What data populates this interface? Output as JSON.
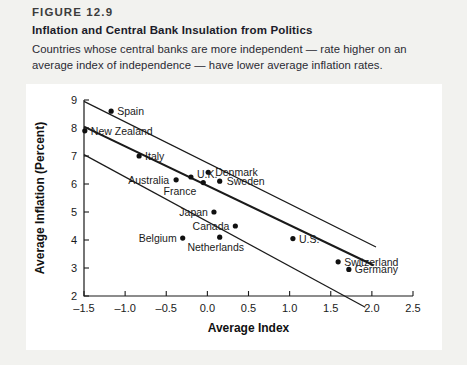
{
  "figure": {
    "label": "FIGURE 12.9",
    "title": "Inflation and Central Bank Insulation from Politics",
    "caption": "Countries whose central banks are more independent — rate higher on an average index of independence — have lower average inflation rates."
  },
  "colors": {
    "page_background": "#f2f2ef",
    "plot_background": "#ffffff",
    "axis": "#1a1a1a",
    "marker": "#101010",
    "line": "#1a1a1a",
    "text": "#1c1c2a"
  },
  "chart_data": {
    "type": "scatter",
    "title": "Inflation and Central Bank Insulation from Politics",
    "xlabel": "Average Index",
    "ylabel": "Average Inflation (Percent)",
    "xlim": [
      -1.5,
      2.5
    ],
    "ylim": [
      2,
      9
    ],
    "xticks": [
      -1.5,
      -1.0,
      -0.5,
      0.0,
      0.5,
      1.0,
      1.5,
      2.0,
      2.5
    ],
    "xtick_labels": [
      "–1.5",
      "–1.0",
      "–0.5",
      "0.0",
      "0.5",
      "1.0",
      "1.5",
      "2.0",
      "2.5"
    ],
    "yticks": [
      2,
      3,
      4,
      5,
      6,
      7,
      8,
      9
    ],
    "ytick_labels": [
      "2",
      "3",
      "4",
      "5",
      "6",
      "7",
      "8",
      "9"
    ],
    "grid": false,
    "legend": false,
    "points": [
      {
        "label": "Spain",
        "x": -1.17,
        "y": 8.6,
        "label_dx": 6,
        "label_dy": 4,
        "anchor": "start"
      },
      {
        "label": "New Zealand",
        "x": -1.49,
        "y": 7.9,
        "label_dx": 6,
        "label_dy": 4,
        "anchor": "start"
      },
      {
        "label": "Italy",
        "x": -0.83,
        "y": 7.0,
        "label_dx": 6,
        "label_dy": 4,
        "anchor": "start"
      },
      {
        "label": "U.K.",
        "x": -0.2,
        "y": 6.25,
        "label_dx": 6,
        "label_dy": 1,
        "anchor": "start"
      },
      {
        "label": "Denmark",
        "x": 0.01,
        "y": 6.42,
        "label_dx": 7,
        "label_dy": 4,
        "anchor": "start"
      },
      {
        "label": "Australia",
        "x": -0.38,
        "y": 6.15,
        "label_dx": -7,
        "label_dy": 4,
        "anchor": "end"
      },
      {
        "label": "Sweden",
        "x": 0.15,
        "y": 6.1,
        "label_dx": 7,
        "label_dy": 4,
        "anchor": "start"
      },
      {
        "label": "France",
        "x": -0.05,
        "y": 6.05,
        "label_dx": -7,
        "label_dy": 12,
        "anchor": "end"
      },
      {
        "label": "Japan",
        "x": 0.08,
        "y": 5.0,
        "label_dx": -6,
        "label_dy": 4,
        "anchor": "end"
      },
      {
        "label": "Canada",
        "x": 0.34,
        "y": 4.5,
        "label_dx": -6,
        "label_dy": 4,
        "anchor": "end"
      },
      {
        "label": "Netherlands",
        "x": 0.15,
        "y": 4.1,
        "label_dx": -4,
        "label_dy": 14,
        "anchor": "middle"
      },
      {
        "label": "Belgium",
        "x": -0.3,
        "y": 4.07,
        "label_dx": -6,
        "label_dy": 4,
        "anchor": "end"
      },
      {
        "label": "U.S.",
        "x": 1.04,
        "y": 4.05,
        "label_dx": 6,
        "label_dy": 4,
        "anchor": "start"
      },
      {
        "label": "Switzerland",
        "x": 1.59,
        "y": 3.22,
        "label_dx": 6,
        "label_dy": 4,
        "anchor": "start"
      },
      {
        "label": "Germany",
        "x": 1.72,
        "y": 2.95,
        "label_dx": 6,
        "label_dy": 4,
        "anchor": "start"
      }
    ],
    "trend_lines": [
      {
        "name": "upper-band",
        "x1": -1.5,
        "y1": 8.95,
        "x2": 2.05,
        "y2": 3.75,
        "width": 1.2
      },
      {
        "name": "fit-line",
        "x1": -1.5,
        "y1": 8.05,
        "x2": 2.02,
        "y2": 3.1,
        "width": 2.1
      },
      {
        "name": "lower-band",
        "x1": -1.5,
        "y1": 7.05,
        "x2": 1.92,
        "y2": 1.6,
        "width": 1.2
      }
    ]
  }
}
